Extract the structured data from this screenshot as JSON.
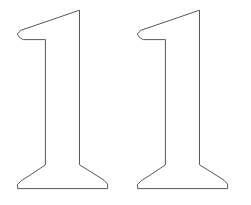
{
  "image": {
    "title": "Two outlined numeral one glyphs",
    "description": "Line-art outline drawing of two serif digit '1' characters side by side on a white background",
    "width": 251,
    "height": 205,
    "background_color": "#ffffff",
    "stroke_color": "#58585a",
    "fill_color": "#ffffff",
    "stroke_width": 1
  },
  "glyphs": [
    {
      "name": "numeral-one-left",
      "character": "1",
      "style": "serif-outline",
      "bbox": {
        "x": 17,
        "y": 10,
        "width": 91,
        "height": 180
      },
      "outline_path": "M 79.5 10.2 L 79.5 164.8 L 89.5 171.0 L 104.0 180.2 L 107.6 184.0 L 107.6 188.6 L 17.6 188.6 L 17.6 184.4 L 21.8 180.4 L 36.0 171.2 L 45.4 164.8 L 45.4 39.6 L 23.2 39.6 L 19.4 37.4 L 17.4 34.0 L 20.6 30.4 L 27.0 28.2 Z"
    },
    {
      "name": "numeral-one-right",
      "character": "1",
      "style": "serif-outline",
      "bbox": {
        "x": 137,
        "y": 10,
        "width": 91,
        "height": 180
      },
      "outline_path": "M 199.5 10.2 L 199.5 164.8 L 209.5 171.0 L 224.0 180.2 L 227.6 184.0 L 227.6 188.6 L 137.6 188.6 L 137.6 184.4 L 141.8 180.4 L 156.0 171.2 L 165.4 164.8 L 165.4 39.6 L 143.2 39.6 L 139.4 37.4 L 137.4 34.0 L 140.6 30.4 L 147.0 28.2 Z"
    }
  ]
}
